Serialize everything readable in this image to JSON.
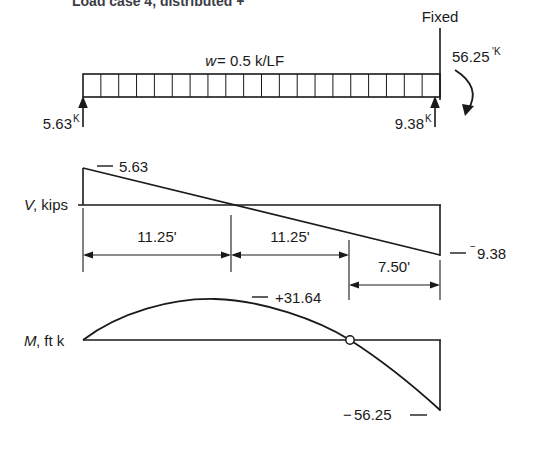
{
  "figure": {
    "title_partial": "Load case 4, distributed   +    ",
    "beam": {
      "load_label": "w",
      "load_equals": " = 0.5 k/LF",
      "fixed_label": "Fixed",
      "left_reaction": "5.63",
      "left_reaction_unit": "K",
      "right_reaction": "9.38",
      "right_reaction_unit": "K",
      "fixed_moment": "56.25",
      "fixed_moment_unit": "'K",
      "cells": 20
    },
    "shear": {
      "axis_label_italic": "V",
      "axis_label_rest": ", kips",
      "max_label": "5.63",
      "max_dash": "—",
      "min_label": "9.38",
      "min_sign": "−",
      "min_dash": "—",
      "dim_1": "11.25'",
      "dim_2": "11.25'",
      "dim_3": "7.50'"
    },
    "moment": {
      "axis_label_italic": "M",
      "axis_label_rest": ", ft k",
      "max_label": "+31.64",
      "max_dash": "—",
      "min_label": "56.25",
      "min_dash_left": "−",
      "min_dash_right": "—"
    },
    "colors": {
      "ink": "#1a1a1a",
      "paper": "#ffffff"
    }
  }
}
